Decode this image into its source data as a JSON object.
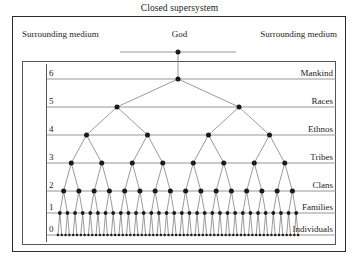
{
  "figure": {
    "title": "Closed supersystem",
    "axis": {
      "ylabel": "Number of hierarchic level",
      "ticks": [
        "6",
        "5",
        "4",
        "3",
        "2",
        "1",
        "0"
      ]
    },
    "surrounding": {
      "left_label": "Surrounding medium",
      "right_label": "Surrounding medium"
    },
    "apex": {
      "label": "God"
    },
    "colors": {
      "node": "#1a1a1a",
      "line": "#7a7a7a",
      "row_line": "#8a8a8a",
      "frame": "#2b2b2b",
      "inner_frame": "#555555",
      "background": "#ffffff"
    }
  },
  "chart_data": {
    "type": "diagram",
    "title": "Closed supersystem",
    "xlabel": "",
    "ylabel": "Number of hierarchic level",
    "ylim": [
      0,
      6
    ],
    "grid": true,
    "legend": "none",
    "levels": [
      {
        "level": "God",
        "tick": "",
        "label": "God",
        "count": 1
      },
      {
        "level": 6,
        "tick": "6",
        "label": "Mankind",
        "count": 1
      },
      {
        "level": 5,
        "tick": "5",
        "label": "Races",
        "count": 2
      },
      {
        "level": 4,
        "tick": "4",
        "label": "Ethnos",
        "count": 4
      },
      {
        "level": 3,
        "tick": "3",
        "label": "Tribes",
        "count": 8
      },
      {
        "level": 2,
        "tick": "2",
        "label": "Clans",
        "count": 16
      },
      {
        "level": 1,
        "tick": "1",
        "label": "Families",
        "count": 32
      },
      {
        "level": 0,
        "tick": "0",
        "label": "Individuals",
        "count": 64
      }
    ],
    "categories": [
      "God",
      "Mankind",
      "Races",
      "Ethnos",
      "Tribes",
      "Clans",
      "Families",
      "Individuals"
    ],
    "values": [
      1,
      1,
      2,
      4,
      8,
      16,
      32,
      64
    ],
    "annotations": [
      "Surrounding medium",
      "Surrounding medium"
    ]
  },
  "geometry": {
    "plot_left": 56,
    "plot_right": 300,
    "god_y": 52,
    "row_y": [
      79,
      107,
      135,
      163,
      191,
      213,
      235
    ],
    "god_bar_half_width": 58
  }
}
